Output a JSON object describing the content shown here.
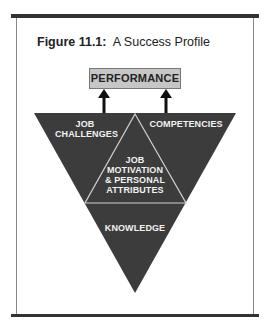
{
  "figure": {
    "title_number": "Figure 11.1:",
    "title_text": "A Success Profile"
  },
  "diagram": {
    "top_box": "PERFORMANCE",
    "segments": {
      "top_left": [
        "JOB",
        "CHALLENGES"
      ],
      "top_right": [
        "COMPETENCIES"
      ],
      "center": [
        "JOB",
        "MOTIVATION",
        "& PERSONAL",
        "ATTRIBUTES"
      ],
      "bottom": [
        "KNOWLEDGE"
      ]
    },
    "colors": {
      "triangle_fill": "#3c3c3c",
      "divider": "#d0d0d0",
      "box_fill": "#c6c6c6",
      "rule": "#333333"
    }
  }
}
